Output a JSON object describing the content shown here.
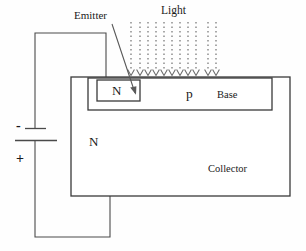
{
  "figure": {
    "background_color": "#fefefe",
    "line_color": "#3a3a3a",
    "text_color": "#1a1a1a"
  },
  "labels": {
    "emitter": "Emitter",
    "light": "Light",
    "emitter_region": "N",
    "base_region": "p",
    "base": "Base",
    "collector_region": "N",
    "collector": "Collector",
    "battery_negative": "-",
    "battery_positive": "+"
  },
  "geometry": {
    "collector_rect": {
      "x": 71,
      "y": 77,
      "width": 219,
      "height": 119
    },
    "base_rect": {
      "x": 88,
      "y": 78,
      "width": 184,
      "height": 32
    },
    "emitter_rect": {
      "x": 97,
      "y": 80,
      "width": 43,
      "height": 21
    },
    "emitter_wire": {
      "x1": 35,
      "y1": 33,
      "x2": 106,
      "y2": 80
    },
    "collector_wire": {
      "x1": 35,
      "y1": 237,
      "x2": 110,
      "y2": 196
    },
    "battery": {
      "x": 35,
      "negative_plate_y": 128,
      "positive_plate_y": 140
    }
  },
  "light_rays": {
    "count": 11,
    "x_positions": [
      131,
      140,
      148,
      156,
      164,
      172,
      180,
      188,
      196,
      208,
      216
    ],
    "top_y": 22,
    "tip_y": 76,
    "style": "dotted-vertical-with-arrowhead",
    "direction": "downward"
  }
}
